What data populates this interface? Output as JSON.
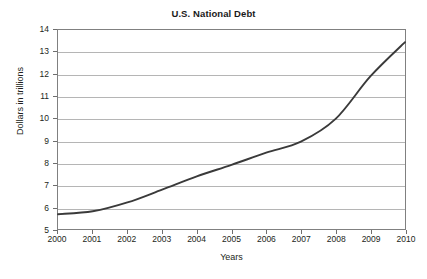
{
  "chart_data": {
    "type": "line",
    "title": "U.S. National Debt",
    "xlabel": "Years",
    "ylabel": "Dollars in trillions",
    "x": [
      2000,
      2001,
      2002,
      2003,
      2004,
      2005,
      2006,
      2007,
      2008,
      2009,
      2010
    ],
    "categories": [
      "2000",
      "2001",
      "2002",
      "2003",
      "2004",
      "2005",
      "2006",
      "2007",
      "2008",
      "2009",
      "2010"
    ],
    "values": [
      5.67,
      5.8,
      6.2,
      6.78,
      7.38,
      7.9,
      8.45,
      8.95,
      9.98,
      11.9,
      13.45
    ],
    "series": [
      {
        "name": "U.S. National Debt",
        "values": [
          5.67,
          5.8,
          6.2,
          6.78,
          7.38,
          7.9,
          8.45,
          8.95,
          9.98,
          11.9,
          13.45
        ]
      }
    ],
    "xlim": [
      2000,
      2010
    ],
    "ylim": [
      5,
      14
    ],
    "ytick_labels": [
      "5",
      "6",
      "7",
      "8",
      "9",
      "10",
      "11",
      "12",
      "13",
      "14"
    ],
    "yticks": [
      5,
      6,
      7,
      8,
      9,
      10,
      11,
      12,
      13,
      14
    ],
    "grid": "horizontal",
    "legend": "none",
    "line_color": "#3a3a3a",
    "grid_color": "#b5b5b5",
    "border_color": "#808080",
    "background_color": "#ffffff"
  }
}
